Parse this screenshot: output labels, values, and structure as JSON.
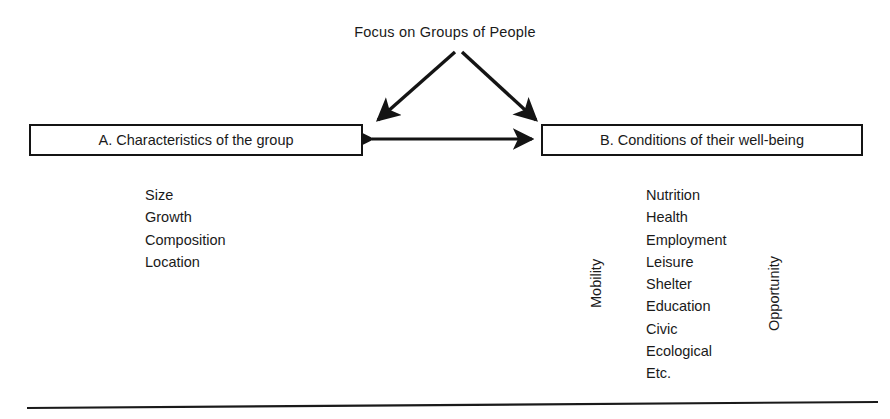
{
  "figure": {
    "title": "Focus on Groups of People"
  },
  "boxes": {
    "a": {
      "label": "A. Characteristics of the group"
    },
    "b": {
      "label": "B. Conditions of their well-being"
    }
  },
  "lists": {
    "characteristics": [
      "Size",
      "Growth",
      "Composition",
      "Location"
    ],
    "conditions": [
      "Nutrition",
      "Health",
      "Employment",
      "Leisure",
      "Shelter",
      "Education",
      "Civic",
      "Ecological",
      "Etc."
    ]
  },
  "side_captions": {
    "left": "Mobility",
    "right": "Opportunity"
  },
  "colors": {
    "ink": "#141414",
    "background": "#ffffff"
  }
}
